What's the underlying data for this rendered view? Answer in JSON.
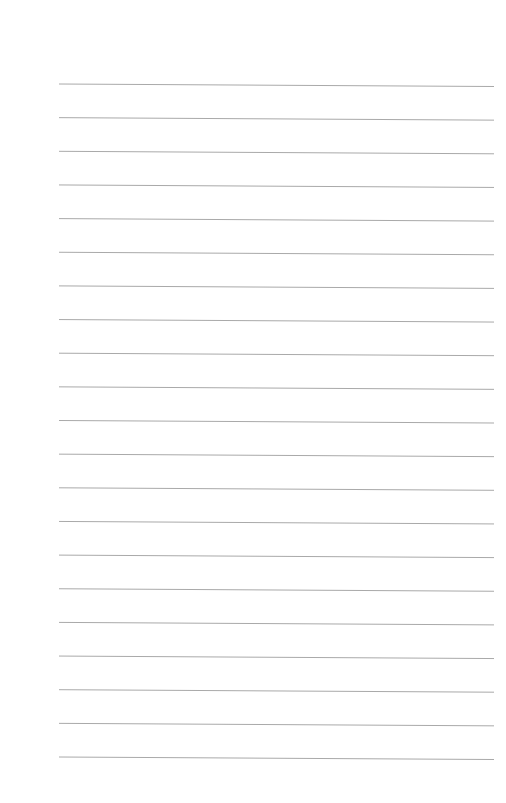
{
  "page": {
    "type": "lined-paper",
    "background_color": "#ffffff",
    "rule_color": "#a9a9a9",
    "rule_count": 21,
    "rule_left_x": 59,
    "rule_right_x": 494,
    "first_rule_y": 84,
    "rule_spacing": 33.65,
    "rule_tilt_px": 2.5
  }
}
